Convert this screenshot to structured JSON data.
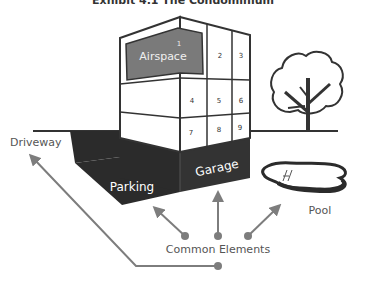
{
  "title": "Exhibit 4.1 The Condominium",
  "building": {
    "airspace_label": "Airspace",
    "units": [
      "1",
      "2",
      "3",
      "4",
      "5",
      "6",
      "7",
      "8",
      "9"
    ]
  },
  "labels": {
    "garage": "Garage",
    "parking": "Parking",
    "driveway": "Driveway",
    "pool": "Pool",
    "common_elements": "Common Elements"
  },
  "colors": {
    "outline": "#333333",
    "dark_fill": "#2b2b2b",
    "airspace_fill": "#7a7a7a",
    "arrow": "#7d7d7d",
    "label_text": "#555555"
  }
}
